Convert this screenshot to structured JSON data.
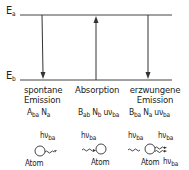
{
  "levels": {
    "upper": {
      "symbol": "E",
      "subscript": "a"
    },
    "lower": {
      "symbol": "E",
      "subscript": "b"
    }
  },
  "processes": [
    {
      "name_line1": "spontane",
      "name_line2": "Emission",
      "arrow_direction": "down",
      "formula": {
        "c1": "A",
        "s1": "ba",
        "c2": "N",
        "s2": "a",
        "c3": "",
        "s3": ""
      },
      "photon_label": {
        "c": "hν",
        "s": "ba"
      },
      "atom_label": "Atom"
    },
    {
      "name_line1": "Absorption",
      "name_line2": "",
      "arrow_direction": "up",
      "formula": {
        "c1": "B",
        "s1": "ab",
        "c2": "N",
        "s2": "b",
        "c3": "uν",
        "s3": "ba"
      },
      "photon_label": {
        "c": "hν",
        "s": "ba"
      },
      "atom_label": "Atom"
    },
    {
      "name_line1": "erzwungene",
      "name_line2": "Emission",
      "arrow_direction": "down",
      "formula": {
        "c1": "B",
        "s1": "ba",
        "c2": "N",
        "s2": "a",
        "c3": "uν",
        "s3": "ba"
      },
      "photon_label": {
        "c": "hν",
        "s": "ba"
      },
      "photon_label_out1": {
        "c": "hν",
        "s": "ba"
      },
      "photon_label_out2": {
        "c": "hν",
        "s": "ba"
      },
      "atom_label": "Atom"
    }
  ],
  "colors": {
    "line": "#333333",
    "text": "#222222",
    "background": "#ffffff"
  }
}
